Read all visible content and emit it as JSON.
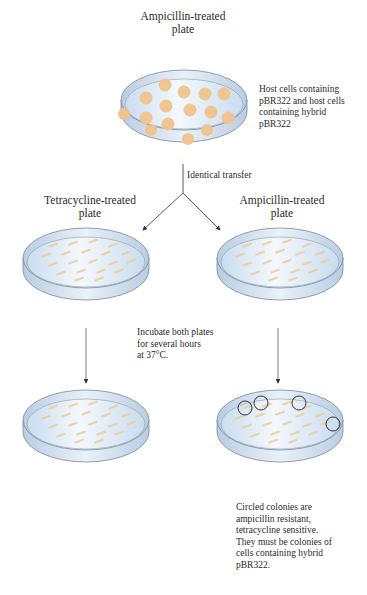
{
  "top": {
    "title_line1": "Ampicillin-treated",
    "title_line2": "plate",
    "annotation": [
      "Host cells containing",
      "pBR322 and host cells",
      "containing hybrid",
      "pBR322"
    ]
  },
  "transfer_label": "Identical transfer",
  "left_plate": {
    "title_line1": "Tetracycline-treated",
    "title_line2": "plate"
  },
  "right_plate": {
    "title_line1": "Ampicillin-treated",
    "title_line2": "plate"
  },
  "incubate": [
    "Incubate both plates",
    "for several hours",
    "at 37°C."
  ],
  "conclusion": [
    "Circled colonies are",
    "ampicillin resistant,",
    "tetracycline sensitive.",
    "They must be colonies of",
    "cells containing hybrid",
    "pBR322."
  ],
  "colors": {
    "colony": "#f0c48e",
    "dish_rim": "#7a8a9a",
    "agar": "#dce9f5",
    "arrow": "#333333"
  }
}
